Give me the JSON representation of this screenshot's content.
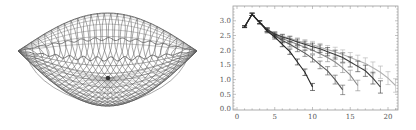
{
  "mesh_panel": {
    "description": "3D wireframe lens-shaped surface mesh",
    "line_color": "#444444"
  },
  "chart_data": {
    "type": "line",
    "title": "",
    "xlabel": "",
    "ylabel": "",
    "xlim": [
      -0.5,
      21.5
    ],
    "ylim": [
      -0.05,
      3.4
    ],
    "x_ticks": [
      0,
      5,
      10,
      15,
      20
    ],
    "x_tick_labels": [
      "0",
      "5",
      "10",
      "15",
      "20"
    ],
    "y_ticks": [
      0.0,
      0.5,
      1.0,
      1.5,
      2.0,
      2.5,
      3.0
    ],
    "y_tick_labels": [
      "0.0",
      "0.5",
      "1.0",
      "1.5",
      "2.0",
      "2.5",
      "3.0"
    ],
    "grid": false,
    "legend": null,
    "error_bars": true,
    "series": [
      {
        "name": "series-1",
        "color": "#222222",
        "x": [
          1,
          2,
          3,
          4,
          5,
          6,
          7,
          8,
          9,
          10
        ],
        "y": [
          2.8,
          3.22,
          2.95,
          2.65,
          2.45,
          2.2,
          1.95,
          1.6,
          1.25,
          0.75
        ]
      },
      {
        "name": "series-2",
        "color": "#555555",
        "x": [
          1,
          2,
          3,
          4,
          5,
          6,
          7,
          8,
          9,
          10,
          11,
          12,
          13,
          14
        ],
        "y": [
          2.8,
          3.22,
          2.95,
          2.68,
          2.5,
          2.33,
          2.2,
          2.05,
          1.9,
          1.72,
          1.5,
          1.3,
          1.0,
          0.65
        ]
      },
      {
        "name": "series-3",
        "color": "#888888",
        "x": [
          1,
          2,
          3,
          4,
          5,
          6,
          7,
          8,
          9,
          10,
          11,
          12,
          13,
          14,
          15,
          16
        ],
        "y": [
          2.8,
          3.22,
          2.95,
          2.7,
          2.52,
          2.4,
          2.3,
          2.2,
          2.1,
          2.0,
          1.88,
          1.75,
          1.6,
          1.4,
          1.15,
          0.8
        ]
      },
      {
        "name": "series-4",
        "color": "#3a3a3a",
        "x": [
          1,
          2,
          3,
          4,
          5,
          6,
          7,
          8,
          9,
          10,
          11,
          12,
          13,
          14,
          15,
          16,
          17,
          18,
          19
        ],
        "y": [
          2.8,
          3.22,
          2.95,
          2.7,
          2.55,
          2.45,
          2.37,
          2.28,
          2.2,
          2.12,
          2.05,
          1.95,
          1.85,
          1.75,
          1.6,
          1.45,
          1.3,
          1.05,
          0.75
        ]
      },
      {
        "name": "series-5",
        "color": "#b0b0b0",
        "x": [
          1,
          2,
          3,
          4,
          5,
          6,
          7,
          8,
          9,
          10,
          11,
          12,
          13,
          14,
          15,
          16,
          17,
          18,
          19,
          20,
          21
        ],
        "y": [
          2.8,
          3.22,
          2.95,
          2.7,
          2.55,
          2.47,
          2.4,
          2.32,
          2.25,
          2.18,
          2.1,
          2.02,
          1.95,
          1.85,
          1.75,
          1.65,
          1.55,
          1.4,
          1.25,
          1.05,
          0.8
        ]
      }
    ]
  }
}
